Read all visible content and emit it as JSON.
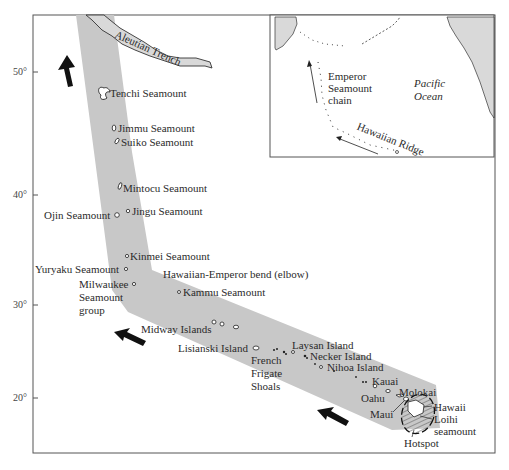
{
  "figure": {
    "colors": {
      "band": "#c8c8c8",
      "frame": "#555555",
      "trench": "#d6d6d6",
      "arrow": "#111111",
      "land": "#d9d9d9"
    }
  },
  "axis": {
    "latitude_ticks": [
      {
        "label": "50°",
        "y": 72
      },
      {
        "label": "40°",
        "y": 195
      },
      {
        "label": "30°",
        "y": 305
      },
      {
        "label": "20°",
        "y": 398
      }
    ]
  },
  "labels": {
    "aleutian_trench": "Aleutian Trench",
    "tenchi": "Tenchi Seamount",
    "jimmu": "Jimmu Seamount",
    "suiko": "Suiko Seamount",
    "mintocu": "Mintocu Seamount",
    "ojin": "Ojin Seamount",
    "jingu": "Jingu Seamount",
    "kinmei": "Kinmei Seamount",
    "yuryaku": "Yuryaku Seamount",
    "bend": "Hawaiian-Emperor bend (elbow)",
    "milwaukee_1": "Milwaukee",
    "milwaukee_2": "Seamount",
    "milwaukee_3": "group",
    "kammu": "Kammu Seamount",
    "midway": "Midway Islands",
    "lisianski": "Lisianski Island",
    "french_1": "French",
    "french_2": "Frigate",
    "french_3": "Shoals",
    "laysan": "Laysan Island",
    "necker": "Necker Island",
    "nihoa": "Nihoa Island",
    "kauai": "Kauai",
    "oahu": "Oahu",
    "molokai": "Molokai",
    "maui": "Maui",
    "hawaii": "Hawaii",
    "loihi_1": "Loihi",
    "loihi_2": "seamount",
    "hotspot": "Hotspot"
  },
  "inset": {
    "emperor_1": "Emperor",
    "emperor_2": "Seamount",
    "emperor_3": "chain",
    "pacific_1": "Pacific",
    "pacific_2": "Ocean",
    "hawaiian_ridge": "Hawaiian Ridge"
  }
}
